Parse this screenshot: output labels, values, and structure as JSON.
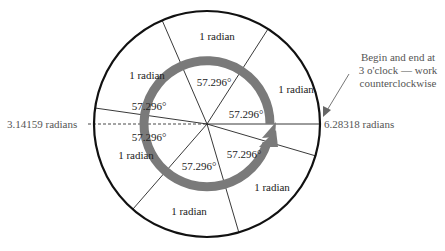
{
  "diagram": {
    "sector_labels": [
      "1 radian",
      "1 radian",
      "1 radian",
      "1 radian",
      "1 radian",
      "1 radian"
    ],
    "degree_labels": [
      "57.296°",
      "57.296°",
      "57.296°",
      "57.296°",
      "57.296°",
      "57.296°"
    ],
    "left_label": "3.14159 radians",
    "right_label": "6.28318 radians",
    "annotation": [
      "Begin and end at",
      "3 o'clock — work",
      "counterclockwise"
    ],
    "colors": {
      "circle": "#111111",
      "arrow": "#7a7a7a",
      "label_gray": "#555555"
    }
  }
}
